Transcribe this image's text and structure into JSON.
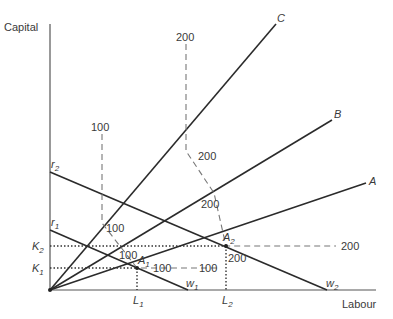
{
  "diagram": {
    "axes": {
      "y_label": "Capital",
      "x_label": "Labour"
    },
    "rays": [
      {
        "label": "C"
      },
      {
        "label": "B"
      },
      {
        "label": "A"
      }
    ],
    "isocost_lines": {
      "r1": {
        "base": "r",
        "sub": "1"
      },
      "r2": {
        "base": "r",
        "sub": "2"
      },
      "w1": {
        "base": "w",
        "sub": "1"
      },
      "w2": {
        "base": "w",
        "sub": "2"
      }
    },
    "points": {
      "A1": {
        "base": "A",
        "sub": "1"
      },
      "A2": {
        "base": "A",
        "sub": "2"
      }
    },
    "y_ticks": {
      "K1": {
        "base": "K",
        "sub": "1"
      },
      "K2": {
        "base": "K",
        "sub": "2"
      }
    },
    "x_ticks": {
      "L1": {
        "base": "L",
        "sub": "1"
      },
      "L2": {
        "base": "L",
        "sub": "2"
      }
    },
    "isoquant_100": {
      "labels": [
        "100",
        "100",
        "100",
        "100",
        "100"
      ]
    },
    "isoquant_200": {
      "labels": [
        "200",
        "200",
        "200",
        "200",
        "200"
      ]
    }
  }
}
